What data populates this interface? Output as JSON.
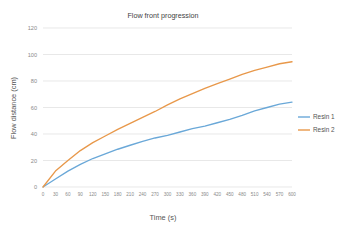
{
  "chart_data": {
    "type": "line",
    "title": "Flow front progression",
    "xlabel": "Time (s)",
    "ylabel": "Flow distance (cm)",
    "xlim": [
      0,
      600
    ],
    "ylim": [
      0,
      120
    ],
    "grid": "horizontal",
    "legend_position": "right",
    "xticks": [
      0,
      30,
      60,
      90,
      120,
      150,
      180,
      210,
      240,
      270,
      300,
      330,
      360,
      390,
      420,
      450,
      480,
      510,
      540,
      570,
      600
    ],
    "yticks": [
      0,
      20,
      40,
      60,
      80,
      100,
      120
    ],
    "x": [
      0,
      30,
      60,
      90,
      120,
      150,
      180,
      210,
      240,
      270,
      300,
      330,
      360,
      390,
      420,
      450,
      480,
      510,
      540,
      570,
      600
    ],
    "series": [
      {
        "name": "Resin 1",
        "color": "#6aa8d8",
        "values": [
          0,
          6,
          12,
          17,
          21.5,
          25,
          28.5,
          31.5,
          34.5,
          37,
          39,
          41.5,
          44,
          46,
          48.5,
          51,
          54,
          57.5,
          60,
          62.5,
          64
        ]
      },
      {
        "name": "Resin 2",
        "color": "#e8984a",
        "values": [
          0,
          12,
          20,
          27.5,
          33.5,
          38.5,
          43.5,
          48,
          52.5,
          57,
          62,
          66.5,
          70.5,
          74.5,
          78,
          81.5,
          85,
          88,
          90.5,
          93,
          94.5
        ]
      }
    ]
  },
  "legend": {
    "items": [
      {
        "label": "Resin 1"
      },
      {
        "label": "Resin 2"
      }
    ]
  }
}
